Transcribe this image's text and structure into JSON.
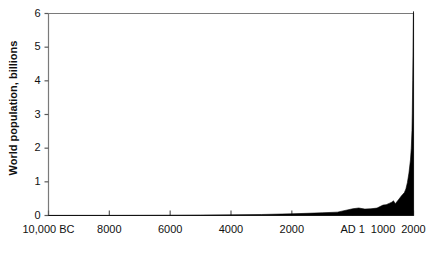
{
  "chart_data": {
    "type": "area",
    "title": "",
    "xlabel": "",
    "ylabel": "World population, billions",
    "ylim": [
      0,
      6
    ],
    "xlim": [
      -10000,
      2000
    ],
    "grid": false,
    "legend": null,
    "yticks": [
      0,
      1,
      2,
      3,
      4,
      5,
      6
    ],
    "ytick_labels": [
      "0",
      "1",
      "2",
      "3",
      "4",
      "5",
      "6"
    ],
    "xticks": [
      -10000,
      -8000,
      -6000,
      -4000,
      -2000,
      1,
      1000,
      2000
    ],
    "xtick_labels": [
      "10,000 BC",
      "8000",
      "6000",
      "4000",
      "2000",
      "AD 1",
      "1000",
      "2000"
    ],
    "series": [
      {
        "name": "World population",
        "fill_color": "#000000",
        "x": [
          -10000,
          -9000,
          -8000,
          -7000,
          -6000,
          -5000,
          -4000,
          -3000,
          -2000,
          -1000,
          -500,
          1,
          200,
          400,
          600,
          800,
          1000,
          1100,
          1200,
          1300,
          1340,
          1400,
          1500,
          1600,
          1700,
          1750,
          1800,
          1850,
          1900,
          1927,
          1950,
          1960,
          1974,
          1987,
          1999,
          2000
        ],
        "values": [
          0.004,
          0.005,
          0.005,
          0.007,
          0.01,
          0.015,
          0.02,
          0.03,
          0.05,
          0.08,
          0.1,
          0.2,
          0.223,
          0.19,
          0.2,
          0.22,
          0.31,
          0.32,
          0.36,
          0.4,
          0.44,
          0.35,
          0.46,
          0.58,
          0.68,
          0.79,
          0.98,
          1.26,
          1.65,
          2.0,
          2.52,
          3.02,
          4.0,
          5.0,
          6.0,
          6.06
        ]
      }
    ]
  },
  "axes": {
    "border_color": "#7a7a7a",
    "tick_color": "#5a5a5a",
    "text_color": "#111111"
  }
}
